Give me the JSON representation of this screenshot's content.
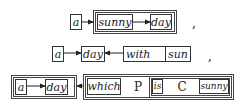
{
  "rows": [
    {
      "nodes": {
        "a": "a",
        "sunny": "sunny",
        "day": "day"
      },
      "separator": ","
    },
    {
      "nodes": {
        "a": "a",
        "day": "day",
        "with": "with",
        "sun": "sun"
      },
      "separator": ","
    },
    {
      "nodes": {
        "a": "a",
        "day": "day",
        "which": "which",
        "P": "P",
        "is": "is",
        "C": "C",
        "sunny": "sunny"
      }
    }
  ],
  "colors": {
    "line": "#333333",
    "background": "#ffffff"
  }
}
